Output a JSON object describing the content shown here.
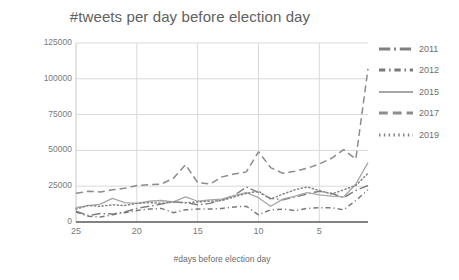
{
  "chart_data": {
    "type": "line",
    "title": "#tweets per day before election day",
    "xlabel": "#days before election day",
    "ylabel": "#tweets with party name",
    "grid": true,
    "legend_position": "right",
    "xlim": [
      25,
      1
    ],
    "x_reversed": true,
    "ylim": [
      0,
      125000
    ],
    "y_ticks": [
      125000,
      100000,
      75000,
      50000,
      25000,
      0
    ],
    "y_tick_labels": [
      "125000",
      "100000",
      "75000",
      "50000",
      "25000",
      "0"
    ],
    "x_ticks": [
      25,
      20,
      15,
      10,
      5
    ],
    "x_tick_labels": [
      "25",
      "20",
      "15",
      "10",
      "5"
    ],
    "x": [
      25,
      24,
      23,
      22,
      21,
      20,
      19,
      18,
      17,
      16,
      15,
      14,
      13,
      12,
      11,
      10,
      9,
      8,
      7,
      6,
      5,
      4,
      3,
      2,
      1
    ],
    "series": [
      {
        "name": "2011",
        "style": "dashdot-long",
        "color": "#808080",
        "values": [
          7500,
          4500,
          6000,
          5500,
          7000,
          9500,
          11000,
          12500,
          14000,
          13500,
          12000,
          13000,
          15500,
          18500,
          24500,
          20500,
          16500,
          15500,
          17500,
          19500,
          21500,
          20000,
          17000,
          22000,
          25500
        ]
      },
      {
        "name": "2012",
        "style": "dashdot-short",
        "color": "#7a7a7a",
        "values": [
          7000,
          4000,
          3500,
          5000,
          6500,
          8000,
          9000,
          9500,
          6500,
          8500,
          9000,
          9000,
          9500,
          10500,
          11000,
          5000,
          8500,
          9000,
          8000,
          9500,
          10000,
          10000,
          8500,
          15000,
          22500
        ]
      },
      {
        "name": "2015",
        "style": "solid",
        "color": "#a6a6a6",
        "values": [
          10000,
          11500,
          12500,
          16500,
          13500,
          13000,
          14500,
          15000,
          14000,
          17500,
          14500,
          15500,
          16000,
          18500,
          20500,
          17000,
          11000,
          16000,
          18000,
          20500,
          19000,
          18000,
          17500,
          26500,
          41500
        ]
      },
      {
        "name": "2017",
        "style": "dashed",
        "color": "#8c8c8c",
        "values": [
          20000,
          21500,
          21000,
          22500,
          23500,
          25500,
          26000,
          26500,
          30500,
          40000,
          27500,
          26500,
          31500,
          33500,
          35000,
          49000,
          38000,
          34000,
          35500,
          37500,
          40500,
          44500,
          50500,
          44000,
          107000
        ]
      },
      {
        "name": "2019",
        "style": "dotted",
        "color": "#848484",
        "values": [
          9000,
          11500,
          11000,
          12000,
          11500,
          13000,
          13500,
          13000,
          14000,
          13500,
          14000,
          14500,
          15000,
          17500,
          20000,
          21500,
          16000,
          19500,
          22500,
          24500,
          22000,
          19500,
          22500,
          25500,
          34000
        ]
      }
    ]
  },
  "legend": {
    "items": [
      {
        "label": "2011"
      },
      {
        "label": "2012"
      },
      {
        "label": "2015"
      },
      {
        "label": "2017"
      },
      {
        "label": "2019"
      }
    ]
  }
}
